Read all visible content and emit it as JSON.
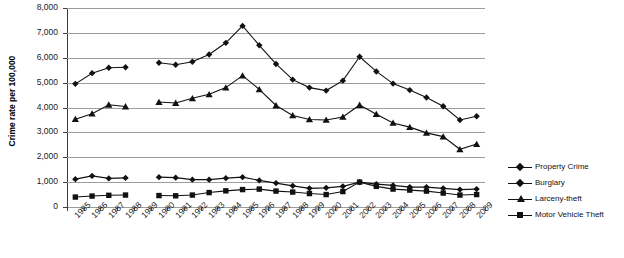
{
  "chart_data": {
    "type": "line",
    "title": "",
    "xlabel": "",
    "ylabel": "Crime rate per 100,000",
    "ylim": [
      0,
      8000
    ],
    "ytick_labels": [
      "8,000",
      "7,000",
      "6,000",
      "5,000",
      "4,000",
      "3,000",
      "2,000",
      "1,000",
      "0"
    ],
    "ytick_values": [
      8000,
      7000,
      6000,
      5000,
      4000,
      3000,
      2000,
      1000,
      0
    ],
    "grid": true,
    "legend_position": "right",
    "categories": [
      "1985",
      "1986",
      "1987",
      "1988",
      "1989",
      "1990",
      "1991",
      "1992",
      "1993",
      "1994",
      "1995",
      "1996",
      "1997",
      "1998",
      "1999",
      "2000",
      "2001",
      "2002",
      "2003",
      "2004",
      "2005",
      "2006",
      "2007",
      "2008",
      "2009"
    ],
    "missing_category": "1989",
    "series": [
      {
        "name": "Property Crime",
        "marker": "diamond",
        "values": [
          4950,
          5380,
          5600,
          5620,
          null,
          5800,
          5720,
          5840,
          6130,
          6600,
          7280,
          6500,
          5750,
          5120,
          4800,
          4680,
          5080,
          6040,
          5450,
          4960,
          4700,
          4400,
          4050,
          3500,
          3650
        ]
      },
      {
        "name": "Burglary",
        "marker": "diamond",
        "values": [
          1120,
          1250,
          1150,
          1170,
          null,
          1200,
          1180,
          1100,
          1100,
          1160,
          1200,
          1070,
          960,
          850,
          750,
          770,
          830,
          1000,
          920,
          870,
          800,
          800,
          750,
          700,
          720
        ]
      },
      {
        "name": "Larceny-theft",
        "marker": "triangle",
        "values": [
          3530,
          3750,
          4110,
          4040,
          null,
          4220,
          4180,
          4370,
          4530,
          4800,
          5280,
          4730,
          4080,
          3680,
          3520,
          3500,
          3620,
          4100,
          3730,
          3380,
          3210,
          2980,
          2830,
          2320,
          2530
        ]
      },
      {
        "name": "Motor Vehicle Theft",
        "marker": "square",
        "values": [
          400,
          440,
          470,
          480,
          null,
          460,
          450,
          480,
          580,
          650,
          700,
          720,
          640,
          600,
          540,
          500,
          620,
          1000,
          830,
          720,
          680,
          640,
          560,
          480,
          500
        ]
      }
    ]
  },
  "legend": {
    "items": [
      {
        "label": "Property Crime",
        "marker": "diamond"
      },
      {
        "label": "Burglary",
        "marker": "diamond"
      },
      {
        "label": "Larceny-theft",
        "marker": "triangle"
      },
      {
        "label": "Motor Vehicle Theft",
        "marker": "square"
      }
    ]
  }
}
